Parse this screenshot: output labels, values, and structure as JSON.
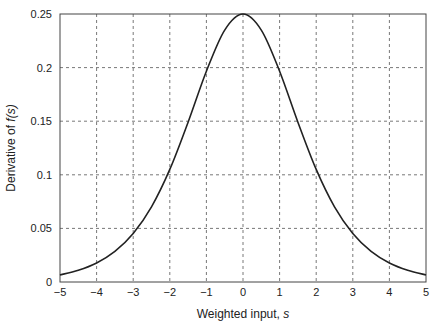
{
  "chart_data": {
    "type": "line",
    "title": "",
    "xlabel": "Weighted input, s",
    "xlabel_text": "Weighted input, ",
    "xlabel_var": "s",
    "ylabel": "Derivative of f(s)",
    "ylabel_text": "Derivative of ",
    "ylabel_var": "f(s)",
    "xlim": [
      -5,
      5
    ],
    "ylim": [
      0,
      0.25
    ],
    "grid": true,
    "legend": null,
    "xticks": [
      -5,
      -4,
      -3,
      -2,
      -1,
      0,
      1,
      2,
      3,
      4,
      5
    ],
    "xtick_labels": [
      "−5",
      "−4",
      "−3",
      "−2",
      "−1",
      "0",
      "1",
      "2",
      "3",
      "4",
      "5"
    ],
    "yticks": [
      0,
      0.05,
      0.1,
      0.15,
      0.2,
      0.25
    ],
    "ytick_labels": [
      "0",
      "0.05",
      "0.1",
      "0.15",
      "0.2",
      "0.25"
    ],
    "series": [
      {
        "name": "f'(s) = f(s)(1 - f(s))",
        "x": [
          -5,
          -4.5,
          -4,
          -3.5,
          -3,
          -2.5,
          -2,
          -1.5,
          -1,
          -0.5,
          0,
          0.5,
          1,
          1.5,
          2,
          2.5,
          3,
          3.5,
          4,
          4.5,
          5
        ],
        "values": [
          0.0066,
          0.0109,
          0.0177,
          0.0285,
          0.0452,
          0.0701,
          0.105,
          0.1491,
          0.1966,
          0.235,
          0.25,
          0.235,
          0.1966,
          0.1491,
          0.105,
          0.0701,
          0.0452,
          0.0285,
          0.0177,
          0.0109,
          0.0066
        ]
      }
    ]
  }
}
